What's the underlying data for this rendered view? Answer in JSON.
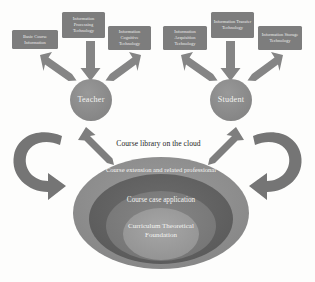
{
  "diagram": {
    "colors": {
      "box_fill": "#7d7d7d",
      "box_fill_alt": "#848484",
      "circle_fill": "#8a8a8a",
      "arrow_fill": "#858585",
      "curved_arrow_fill": "#6f6f6f",
      "ellipse_outer": "#8e8e8e",
      "ellipse_middle": "#626262",
      "ellipse_inner": "#7a7a7a",
      "ellipse_core": "#9a9a9a",
      "text_light": "#f2f2f0",
      "text_dark": "#1d1d1d",
      "background": "#fdfdfc"
    },
    "top_boxes": [
      {
        "id": "basic-course-information",
        "label": "Basic Course Information",
        "x": 12,
        "y": 30,
        "w": 46,
        "h": 19
      },
      {
        "id": "information-processing-technology",
        "label": "Information Processing Technology",
        "x": 62,
        "y": 12,
        "w": 43,
        "h": 26
      },
      {
        "id": "information-cognitive-technology",
        "label": "Information Cognitive Technology",
        "x": 108,
        "y": 26,
        "w": 43,
        "h": 24
      },
      {
        "id": "information-acquisition-technology",
        "label": "Information Acquisition Technology",
        "x": 163,
        "y": 26,
        "w": 44,
        "h": 24
      },
      {
        "id": "information-transfer-technology",
        "label": "Information Transfer Technology",
        "x": 211,
        "y": 12,
        "w": 43,
        "h": 26
      },
      {
        "id": "information-storage-technology",
        "label": "Information Storage Technology",
        "x": 258,
        "y": 26,
        "w": 44,
        "h": 24
      }
    ],
    "role_circles": [
      {
        "id": "teacher",
        "label": "Teacher",
        "cx": 91,
        "cy": 100,
        "r": 21
      },
      {
        "id": "student",
        "label": "Student",
        "cx": 231,
        "cy": 100,
        "r": 21
      }
    ],
    "cloud_label": "Course library on the cloud",
    "ellipse_layers": [
      {
        "id": "course-extension",
        "label": "Course extension and related professional"
      },
      {
        "id": "course-case-application",
        "label": "Course case application"
      },
      {
        "id": "curriculum-theoretical-foundation",
        "label": "Curriculum Theoretical Foundation"
      }
    ],
    "caption": ""
  }
}
